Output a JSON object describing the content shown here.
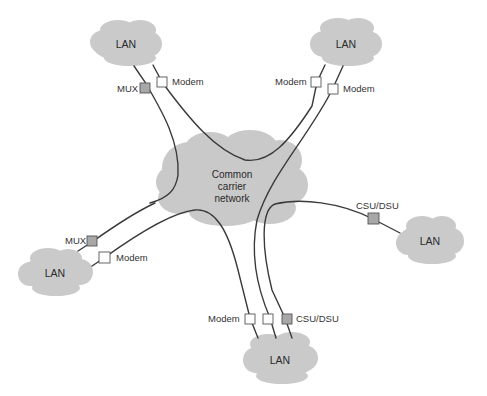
{
  "diagram": {
    "colors": {
      "cloud_fill": "#c9c9c9",
      "line": "#3a3a3a",
      "device_gray": "#a8a8a8",
      "device_white": "#ffffff",
      "device_border": "#555555",
      "text": "#333333"
    },
    "central_network": {
      "line1": "Common",
      "line2": "carrier",
      "line3": "network"
    },
    "lans": {
      "top_left": "LAN",
      "top_right": "LAN",
      "right": "LAN",
      "bottom": "LAN",
      "left": "LAN"
    },
    "devices": {
      "top_left_mux": "MUX",
      "top_left_modem": "Modem",
      "top_right_modem_a": "Modem",
      "top_right_modem_b": "Modem",
      "right_csu_dsu": "CSU/DSU",
      "left_mux": "MUX",
      "left_modem": "Modem",
      "bottom_modem": "Modem",
      "bottom_csu_dsu": "CSU/DSU"
    }
  }
}
